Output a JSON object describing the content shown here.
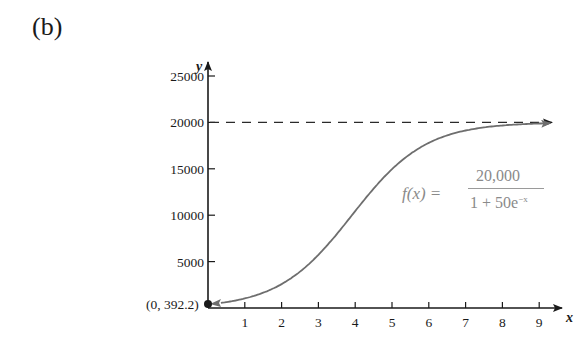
{
  "panel_label": "(b)",
  "formula": {
    "lhs": "f(x) =",
    "numerator": "20,000",
    "denominator_base": "1 + 50e",
    "denominator_exponent": "−x"
  },
  "chart_data": {
    "type": "line",
    "title": "",
    "xlabel": "x",
    "ylabel": "y",
    "x_ticks": [
      1,
      2,
      3,
      4,
      5,
      6,
      7,
      8,
      9
    ],
    "y_ticks": [
      5000,
      10000,
      15000,
      20000,
      25000
    ],
    "xlim": [
      0,
      9.5
    ],
    "ylim": [
      0,
      26500
    ],
    "grid": false,
    "legend": null,
    "function": "f(x) = 20000 / (1 + 50 e^(-x))",
    "series": [
      {
        "name": "f(x)",
        "x": [
          0,
          1,
          2,
          3,
          4,
          5,
          6,
          7,
          8,
          9
        ],
        "values": [
          392.2,
          1039.9,
          2574.8,
          5727.2,
          10439.7,
          14958.8,
          17794.5,
          19114.1,
          19660.1,
          19869.8
        ],
        "style": "solid gray, arrow at right end"
      }
    ],
    "asymptote": {
      "y": 20000,
      "style": "dashed",
      "arrow": "right"
    },
    "annotations": [
      {
        "text": "(0, 392.2)",
        "x": 0,
        "y": 392.2,
        "marker": "filled dot"
      }
    ]
  }
}
